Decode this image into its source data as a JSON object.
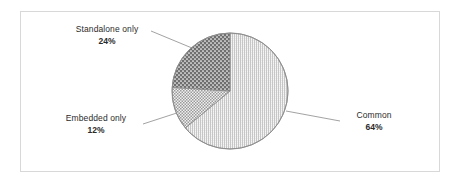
{
  "chart_data": {
    "type": "pie",
    "title": "",
    "subtitle": "",
    "xlabel": "",
    "ylabel": "",
    "legend_position": "none",
    "grid": false,
    "labels_show_percent": true,
    "start_angle_deg": 0,
    "direction": "clockwise",
    "categories": [
      "Common",
      "Embedded only",
      "Standalone only"
    ],
    "values": [
      64,
      12,
      24
    ],
    "units": "%",
    "slices": [
      {
        "name": "Common",
        "percent": 64,
        "percent_label": "64%",
        "angle_deg": 230.4,
        "fill": "#d9d9d9",
        "pattern": "fine-vertical-dots"
      },
      {
        "name": "Embedded only",
        "percent": 12,
        "percent_label": "12%",
        "angle_deg": 43.2,
        "fill": "#b0b0b0",
        "pattern": "checkerboard"
      },
      {
        "name": "Standalone only",
        "percent": 24,
        "percent_label": "24%",
        "angle_deg": 86.4,
        "fill": "#777777",
        "pattern": "dark-with-white-dots"
      }
    ]
  },
  "labels": {
    "standalone": {
      "name": "Standalone only",
      "percent": "24%"
    },
    "embedded": {
      "name": "Embedded only",
      "percent": "12%"
    },
    "common": {
      "name": "Common",
      "percent": "64%"
    }
  },
  "colors": {
    "frame_border": "#d8d8d8",
    "background": "#ffffff",
    "text": "#2b2b2b",
    "leader_line": "#8a8a8a",
    "slice_outline": "#8a8a8a"
  }
}
